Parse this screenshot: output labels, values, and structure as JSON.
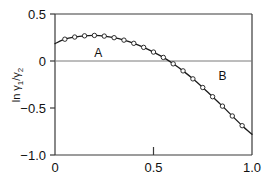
{
  "chart_data": {
    "type": "scatter",
    "title": "",
    "subtitle": "",
    "xlabel": "",
    "ylabel": "ln γ₁/γ₂",
    "ylabel_parts": {
      "prefix": "ln ",
      "gamma1": "γ",
      "sub1": "1",
      "slash": "/",
      "gamma2": "γ",
      "sub2": "2"
    },
    "xlim": [
      0.0,
      1.0
    ],
    "ylim": [
      -1.0,
      0.5
    ],
    "xticks": [
      0.0,
      0.5,
      1.0
    ],
    "xtick_labels": [
      "0",
      "0.5",
      "1.0"
    ],
    "yticks": [
      0.5,
      0.0,
      -0.5,
      -1.0
    ],
    "ytick_labels": [
      "0.5",
      "0",
      "−0.5",
      "−1.0"
    ],
    "grid": false,
    "zero_line": true,
    "legend": "none",
    "marker": "open-circle",
    "series": [
      {
        "name": "experimental points",
        "marker": "open-circle",
        "x": [
          0.0,
          0.05,
          0.1,
          0.15,
          0.2,
          0.25,
          0.3,
          0.35,
          0.4,
          0.45,
          0.5,
          0.55,
          0.6,
          0.65,
          0.7,
          0.75,
          0.8,
          0.85,
          0.9,
          0.95,
          1.0
        ],
        "y": [
          0.185,
          0.232,
          0.255,
          0.268,
          0.272,
          0.265,
          0.248,
          0.222,
          0.188,
          0.145,
          0.095,
          0.038,
          -0.03,
          -0.105,
          -0.19,
          -0.282,
          -0.38,
          -0.48,
          -0.585,
          -0.688,
          -0.78
        ]
      }
    ],
    "fitted_curve": {
      "name": "smooth fit",
      "x": [
        0.0,
        0.05,
        0.1,
        0.15,
        0.2,
        0.25,
        0.3,
        0.35,
        0.4,
        0.45,
        0.5,
        0.55,
        0.6,
        0.65,
        0.7,
        0.75,
        0.8,
        0.85,
        0.9,
        0.95,
        1.0
      ],
      "y": [
        0.185,
        0.232,
        0.255,
        0.268,
        0.272,
        0.265,
        0.248,
        0.222,
        0.188,
        0.145,
        0.095,
        0.038,
        -0.03,
        -0.105,
        -0.19,
        -0.282,
        -0.38,
        -0.48,
        -0.585,
        -0.688,
        -0.78
      ]
    },
    "annotations": [
      {
        "text": "A",
        "x": 0.22,
        "y": 0.09
      },
      {
        "text": "B",
        "x": 0.85,
        "y": -0.16
      }
    ],
    "zero_crossing_x": 0.575,
    "maximum": {
      "x": 0.2,
      "y": 0.272
    },
    "colors": {
      "axis": "#3a3a3a",
      "curve": "#1a1a1a",
      "marker_face": "#ffffff",
      "marker_edge": "#1a1a1a",
      "zero_line": "#7a7a7a",
      "text": "#111111",
      "background": "#ffffff"
    }
  }
}
